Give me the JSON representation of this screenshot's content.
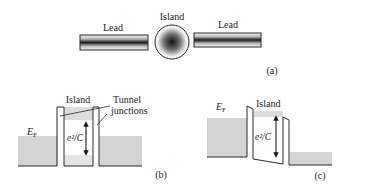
{
  "panel_a": {
    "lead_left_label": "Lead",
    "island_label": "Island",
    "lead_right_label": "Lead",
    "panel_label": "(a)"
  },
  "panel_b": {
    "fermi_label_main": "E",
    "fermi_label_sub": "F",
    "island_label": "Island",
    "tunnel_label_line1": "Tunnel",
    "tunnel_label_line2": "junctions",
    "charging_energy_label": "e²/C",
    "panel_label": "(b)"
  },
  "panel_c": {
    "fermi_label_main": "E",
    "fermi_label_sub": "F",
    "island_label": "Island",
    "charging_energy_label": "e²/C",
    "panel_label": "(c)"
  },
  "colors": {
    "line": "#2a2a2a",
    "fill_gray": "#d4d4d4",
    "fill_light": "#e2e2e2"
  }
}
